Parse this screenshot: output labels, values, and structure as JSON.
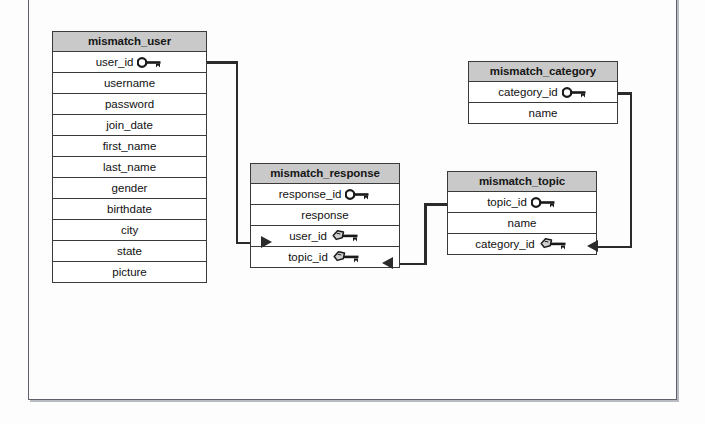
{
  "diagram": {
    "type": "entity-relationship-diagram",
    "background_color": "#fdfdfd",
    "header_fill": "#c9c9c9",
    "line_color": "#2b2b2b"
  },
  "tables": [
    {
      "id": "user",
      "name": "mismatch_user",
      "fields": [
        {
          "name": "user_id",
          "key": "pk"
        },
        {
          "name": "username",
          "key": "none"
        },
        {
          "name": "password",
          "key": "none"
        },
        {
          "name": "join_date",
          "key": "none"
        },
        {
          "name": "first_name",
          "key": "none"
        },
        {
          "name": "last_name",
          "key": "none"
        },
        {
          "name": "gender",
          "key": "none"
        },
        {
          "name": "birthdate",
          "key": "none"
        },
        {
          "name": "city",
          "key": "none"
        },
        {
          "name": "state",
          "key": "none"
        },
        {
          "name": "picture",
          "key": "none"
        }
      ]
    },
    {
      "id": "response",
      "name": "mismatch_response",
      "fields": [
        {
          "name": "response_id",
          "key": "pk"
        },
        {
          "name": "response",
          "key": "none"
        },
        {
          "name": "user_id",
          "key": "fk"
        },
        {
          "name": "topic_id",
          "key": "fk"
        }
      ]
    },
    {
      "id": "topic",
      "name": "mismatch_topic",
      "fields": [
        {
          "name": "topic_id",
          "key": "pk"
        },
        {
          "name": "name",
          "key": "none"
        },
        {
          "name": "category_id",
          "key": "fk"
        }
      ]
    },
    {
      "id": "category",
      "name": "mismatch_category",
      "fields": [
        {
          "name": "category_id",
          "key": "pk"
        },
        {
          "name": "name",
          "key": "none"
        }
      ]
    }
  ],
  "relationships": [
    {
      "id": "user-to-response",
      "from_table": "mismatch_user",
      "from_field": "user_id",
      "to_table": "mismatch_response",
      "to_field": "user_id"
    },
    {
      "id": "topic-to-response",
      "from_table": "mismatch_topic",
      "from_field": "topic_id",
      "to_table": "mismatch_response",
      "to_field": "topic_id"
    },
    {
      "id": "category-to-topic",
      "from_table": "mismatch_category",
      "from_field": "category_id",
      "to_table": "mismatch_topic",
      "to_field": "category_id"
    }
  ],
  "icons": {
    "pk": "primary-key-icon",
    "fk": "foreign-key-icon"
  }
}
